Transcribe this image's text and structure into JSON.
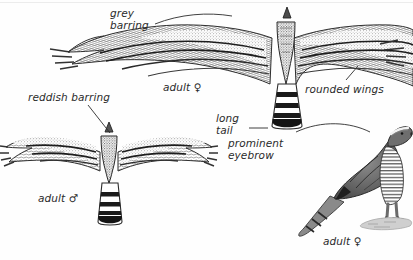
{
  "plate": {
    "title": "Hawk identification plate",
    "style": "pen-and-ink grayscale field guide illustration",
    "background_color": "#fefefe",
    "ink_color": "#2b2b2b"
  },
  "labels": {
    "grey_barring": "grey\nbarring",
    "reddish_barring": "reddish barring",
    "rounded_wings": "rounded wings",
    "long_tail": "long\ntail",
    "prominent_eyebrow": "prominent\neyebrow",
    "adult_female_flight": "adult ♀",
    "adult_male_flight": "adult ♂",
    "adult_female_perched": "adult ♀"
  },
  "figures": [
    {
      "id": "female-in-flight",
      "caption": "adult ♀",
      "view": "underside, wings spread",
      "tail_bands": 4,
      "annotations": [
        "grey barring",
        "rounded wings",
        "long tail"
      ]
    },
    {
      "id": "male-in-flight",
      "caption": "adult ♂",
      "view": "underside, wings spread",
      "tail_bands": 4,
      "annotations": [
        "reddish barring"
      ]
    },
    {
      "id": "female-perched",
      "caption": "adult ♀",
      "view": "profile, perched on rock facing right",
      "annotations": [
        "prominent eyebrow"
      ]
    }
  ]
}
